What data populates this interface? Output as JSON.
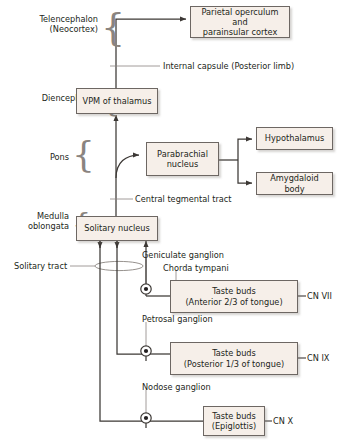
{
  "colors": {
    "background": "#ffffff",
    "box_fill": "#f6efe9",
    "box_border": "#6d6763",
    "line": "#3c3835",
    "thin_line": "#8a8480",
    "text": "#231f20",
    "brace": "#8a8480"
  },
  "levels": [
    {
      "name": "telencephalon",
      "label": "Telencephalon\n(Neocortex)"
    },
    {
      "name": "diencephalon",
      "label": "Diencephalon"
    },
    {
      "name": "pons",
      "label": "Pons"
    },
    {
      "name": "medulla",
      "label": "Medulla\noblongata"
    }
  ],
  "boxes": [
    {
      "name": "parietal-operculum",
      "label": "Parietal operculum and\nparainsular cortex"
    },
    {
      "name": "vpm-thalamus",
      "label": "VPM of thalamus"
    },
    {
      "name": "parabrachial-nucleus",
      "label": "Parabrachial\nnucleus"
    },
    {
      "name": "hypothalamus",
      "label": "Hypothalamus"
    },
    {
      "name": "amygdaloid-body",
      "label": "Amygdaloid body"
    },
    {
      "name": "solitary-nucleus",
      "label": "Solitary nucleus"
    },
    {
      "name": "taste-buds-anterior",
      "label": "Taste buds\n(Anterior 2/3 of tongue)"
    },
    {
      "name": "taste-buds-posterior",
      "label": "Taste buds\n(Posterior 1/3 of tongue)"
    },
    {
      "name": "taste-buds-epiglottis",
      "label": "Taste buds\n(Epiglottis)"
    }
  ],
  "tract_labels": [
    {
      "name": "internal-capsule",
      "label": "Internal capsule (Posterior limb)"
    },
    {
      "name": "central-tegmental-tract",
      "label": "Central tegmental tract"
    },
    {
      "name": "solitary-tract",
      "label": "Solitary tract"
    }
  ],
  "ganglia": [
    {
      "name": "geniculate-ganglion",
      "label": "Geniculate ganglion"
    },
    {
      "name": "chorda-tympani",
      "label": "Chorda tympani"
    },
    {
      "name": "petrosal-ganglion",
      "label": "Petrosal ganglion"
    },
    {
      "name": "nodose-ganglion",
      "label": "Nodose ganglion"
    }
  ],
  "cranial_nerves": [
    {
      "name": "cn-vii",
      "label": "CN VII"
    },
    {
      "name": "cn-ix",
      "label": "CN IX"
    },
    {
      "name": "cn-x",
      "label": "CN X"
    }
  ]
}
